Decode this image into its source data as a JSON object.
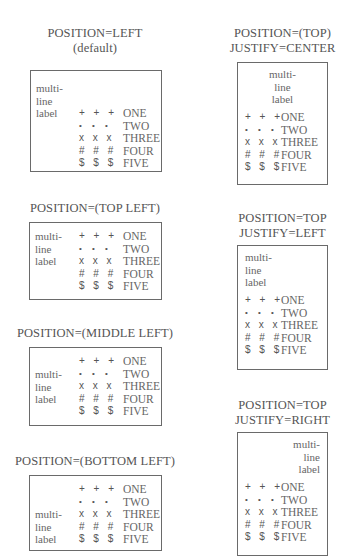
{
  "label_lines": [
    "multi-",
    "line",
    "label"
  ],
  "entries": [
    {
      "symbols": "+ + +",
      "text": "ONE",
      "icon": "plus-icon"
    },
    {
      "symbols": "• • •",
      "text": "TWO",
      "icon": "bullet-icon"
    },
    {
      "symbols": "x x x",
      "text": "THREE",
      "icon": "cross-icon"
    },
    {
      "symbols": "# # #",
      "text": "FOUR",
      "icon": "hash-icon"
    },
    {
      "symbols": "$ $ $",
      "text": "FIVE",
      "icon": "dollar-icon"
    }
  ],
  "panels": [
    {
      "id": "left-default",
      "title_lines": [
        "POSITION=LEFT",
        "(default)"
      ]
    },
    {
      "id": "top-left",
      "title_lines": [
        "POSITION=(TOP LEFT)"
      ]
    },
    {
      "id": "middle-left",
      "title_lines": [
        "POSITION=(MIDDLE LEFT)"
      ]
    },
    {
      "id": "bottom-left",
      "title_lines": [
        "POSITION=(BOTTOM LEFT)"
      ]
    },
    {
      "id": "top-center",
      "title_lines": [
        "POSITION=(TOP)",
        "JUSTIFY=CENTER"
      ]
    },
    {
      "id": "top-justify-left",
      "title_lines": [
        "POSITION=TOP",
        "JUSTIFY=LEFT"
      ]
    },
    {
      "id": "top-justify-right",
      "title_lines": [
        "POSITION=TOP",
        "JUSTIFY=RIGHT"
      ]
    }
  ]
}
